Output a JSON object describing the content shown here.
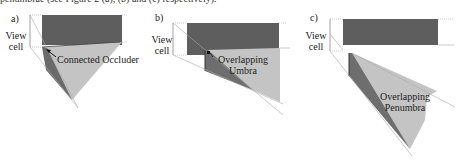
{
  "caption_fragment": "penumbrae (see Figure 2 (a), (b) and (c) respectively).",
  "panels": [
    {
      "id": "a",
      "label": "a)",
      "view_cell_line1": "View",
      "view_cell_line2": "cell",
      "annotation": "Connected Occluder"
    },
    {
      "id": "b",
      "label": "b)",
      "view_cell_line1": "View",
      "view_cell_line2": "cell",
      "annotation_line1": "Overlapping",
      "annotation_line2": "Umbra"
    },
    {
      "id": "c",
      "label": "c)",
      "view_cell_line1": "View",
      "view_cell_line2": "cell",
      "annotation_line1": "Overlapping",
      "annotation_line2": "Penumbra"
    }
  ],
  "colors": {
    "occluder_dark": "#5e5e5e",
    "occluder_mid": "#7a7a7a",
    "umbra_light": "#c4c4c4",
    "guide_lines": "#999999"
  }
}
